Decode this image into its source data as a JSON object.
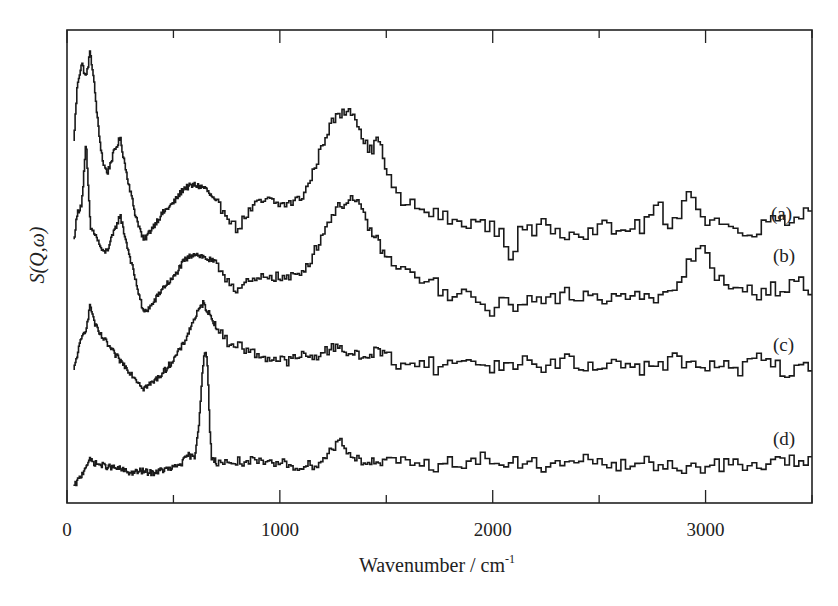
{
  "chart_data": {
    "type": "line",
    "title": "",
    "xlabel": "Wavenumber / cm",
    "xlabel_superscript": "-1",
    "ylabel": "S(Q,ω)",
    "xlim": [
      0,
      3500
    ],
    "ylim_note": "arbitrary units (no y ticks); values are relative intensities with vertical offsets",
    "x_ticks_major": [
      0,
      1000,
      2000,
      3000
    ],
    "x_tick_labels": [
      "0",
      "1000",
      "2000",
      "3000"
    ],
    "x_ticks_minor": [
      500,
      1500,
      2500,
      3500
    ],
    "grid": false,
    "legend": "inline labels at right",
    "step_style": true,
    "series": [
      {
        "name": "(a)",
        "label": "(a)",
        "points": [
          [
            30,
            355
          ],
          [
            50,
            420
          ],
          [
            70,
            440
          ],
          [
            90,
            425
          ],
          [
            110,
            452
          ],
          [
            130,
            415
          ],
          [
            150,
            370
          ],
          [
            170,
            340
          ],
          [
            190,
            330
          ],
          [
            220,
            350
          ],
          [
            250,
            365
          ],
          [
            280,
            330
          ],
          [
            320,
            290
          ],
          [
            360,
            262
          ],
          [
            400,
            275
          ],
          [
            450,
            290
          ],
          [
            500,
            300
          ],
          [
            550,
            315
          ],
          [
            600,
            318
          ],
          [
            650,
            315
          ],
          [
            700,
            300
          ],
          [
            750,
            290
          ],
          [
            800,
            273
          ],
          [
            850,
            290
          ],
          [
            900,
            300
          ],
          [
            950,
            303
          ],
          [
            1000,
            298
          ],
          [
            1050,
            300
          ],
          [
            1100,
            305
          ],
          [
            1140,
            320
          ],
          [
            1180,
            345
          ],
          [
            1220,
            370
          ],
          [
            1260,
            385
          ],
          [
            1300,
            390
          ],
          [
            1330,
            395
          ],
          [
            1360,
            385
          ],
          [
            1400,
            360
          ],
          [
            1440,
            350
          ],
          [
            1460,
            373
          ],
          [
            1490,
            340
          ],
          [
            1530,
            315
          ],
          [
            1560,
            303
          ],
          [
            1600,
            300
          ],
          [
            1650,
            295
          ],
          [
            1700,
            290
          ],
          [
            1750,
            288
          ],
          [
            1800,
            283
          ],
          [
            1850,
            278
          ],
          [
            1900,
            283
          ],
          [
            1940,
            278
          ],
          [
            2000,
            275
          ],
          [
            2050,
            270
          ],
          [
            2090,
            238
          ],
          [
            2130,
            280
          ],
          [
            2200,
            268
          ],
          [
            2250,
            280
          ],
          [
            2300,
            272
          ],
          [
            2350,
            270
          ],
          [
            2400,
            275
          ],
          [
            2450,
            268
          ],
          [
            2500,
            280
          ],
          [
            2550,
            273
          ],
          [
            2600,
            270
          ],
          [
            2650,
            278
          ],
          [
            2700,
            275
          ],
          [
            2780,
            301
          ],
          [
            2820,
            270
          ],
          [
            2860,
            280
          ],
          [
            2900,
            305
          ],
          [
            2920,
            318
          ],
          [
            2950,
            305
          ],
          [
            2980,
            283
          ],
          [
            3050,
            283
          ],
          [
            3100,
            278
          ],
          [
            3150,
            270
          ],
          [
            3200,
            275
          ],
          [
            3250,
            270
          ],
          [
            3300,
            285
          ],
          [
            3350,
            288
          ],
          [
            3400,
            282
          ],
          [
            3450,
            290
          ],
          [
            3500,
            293
          ]
        ]
      },
      {
        "name": "(b)",
        "label": "(b)",
        "points": [
          [
            30,
            260
          ],
          [
            50,
            290
          ],
          [
            70,
            300
          ],
          [
            90,
            360
          ],
          [
            110,
            275
          ],
          [
            130,
            270
          ],
          [
            150,
            260
          ],
          [
            170,
            250
          ],
          [
            190,
            253
          ],
          [
            220,
            270
          ],
          [
            250,
            288
          ],
          [
            280,
            260
          ],
          [
            320,
            225
          ],
          [
            360,
            190
          ],
          [
            400,
            198
          ],
          [
            450,
            215
          ],
          [
            500,
            225
          ],
          [
            550,
            242
          ],
          [
            600,
            250
          ],
          [
            650,
            245
          ],
          [
            700,
            240
          ],
          [
            750,
            225
          ],
          [
            800,
            213
          ],
          [
            850,
            220
          ],
          [
            900,
            223
          ],
          [
            950,
            228
          ],
          [
            1000,
            225
          ],
          [
            1050,
            225
          ],
          [
            1100,
            230
          ],
          [
            1150,
            245
          ],
          [
            1200,
            268
          ],
          [
            1250,
            290
          ],
          [
            1300,
            300
          ],
          [
            1340,
            305
          ],
          [
            1380,
            295
          ],
          [
            1420,
            275
          ],
          [
            1460,
            262
          ],
          [
            1500,
            245
          ],
          [
            1550,
            235
          ],
          [
            1600,
            230
          ],
          [
            1650,
            225
          ],
          [
            1700,
            225
          ],
          [
            1750,
            215
          ],
          [
            1800,
            203
          ],
          [
            1850,
            210
          ],
          [
            1900,
            205
          ],
          [
            1950,
            198
          ],
          [
            2000,
            193
          ],
          [
            2050,
            200
          ],
          [
            2100,
            196
          ],
          [
            2150,
            205
          ],
          [
            2200,
            200
          ],
          [
            2250,
            208
          ],
          [
            2300,
            200
          ],
          [
            2350,
            210
          ],
          [
            2400,
            205
          ],
          [
            2450,
            210
          ],
          [
            2500,
            203
          ],
          [
            2550,
            208
          ],
          [
            2600,
            213
          ],
          [
            2650,
            205
          ],
          [
            2700,
            208
          ],
          [
            2750,
            200
          ],
          [
            2800,
            205
          ],
          [
            2850,
            212
          ],
          [
            2900,
            230
          ],
          [
            2950,
            250
          ],
          [
            2980,
            260
          ],
          [
            3020,
            245
          ],
          [
            3060,
            225
          ],
          [
            3100,
            215
          ],
          [
            3150,
            210
          ],
          [
            3200,
            213
          ],
          [
            3250,
            210
          ],
          [
            3300,
            215
          ],
          [
            3350,
            213
          ],
          [
            3400,
            218
          ],
          [
            3450,
            220
          ],
          [
            3500,
            210
          ]
        ]
      },
      {
        "name": "(c)",
        "label": "(c)",
        "points": [
          [
            30,
            130
          ],
          [
            50,
            150
          ],
          [
            70,
            165
          ],
          [
            90,
            175
          ],
          [
            110,
            198
          ],
          [
            130,
            180
          ],
          [
            150,
            170
          ],
          [
            180,
            162
          ],
          [
            220,
            150
          ],
          [
            260,
            140
          ],
          [
            300,
            130
          ],
          [
            340,
            120
          ],
          [
            360,
            115
          ],
          [
            400,
            120
          ],
          [
            450,
            130
          ],
          [
            500,
            143
          ],
          [
            550,
            160
          ],
          [
            600,
            185
          ],
          [
            640,
            200
          ],
          [
            680,
            185
          ],
          [
            720,
            170
          ],
          [
            760,
            160
          ],
          [
            810,
            158
          ],
          [
            850,
            152
          ],
          [
            900,
            148
          ],
          [
            950,
            145
          ],
          [
            1000,
            143
          ],
          [
            1050,
            142
          ],
          [
            1100,
            148
          ],
          [
            1150,
            145
          ],
          [
            1200,
            150
          ],
          [
            1250,
            155
          ],
          [
            1280,
            158
          ],
          [
            1320,
            150
          ],
          [
            1360,
            148
          ],
          [
            1400,
            145
          ],
          [
            1460,
            153
          ],
          [
            1500,
            148
          ],
          [
            1550,
            140
          ],
          [
            1600,
            143
          ],
          [
            1650,
            135
          ],
          [
            1700,
            145
          ],
          [
            1750,
            130
          ],
          [
            1800,
            140
          ],
          [
            1850,
            145
          ],
          [
            1900,
            138
          ],
          [
            1950,
            142
          ],
          [
            2000,
            135
          ],
          [
            2100,
            140
          ],
          [
            2150,
            143
          ],
          [
            2200,
            135
          ],
          [
            2300,
            140
          ],
          [
            2350,
            145
          ],
          [
            2400,
            135
          ],
          [
            2500,
            133
          ],
          [
            2550,
            145
          ],
          [
            2600,
            138
          ],
          [
            2650,
            145
          ],
          [
            2700,
            130
          ],
          [
            2750,
            142
          ],
          [
            2800,
            138
          ],
          [
            2850,
            145
          ],
          [
            2900,
            140
          ],
          [
            2950,
            135
          ],
          [
            3000,
            140
          ],
          [
            3050,
            135
          ],
          [
            3100,
            138
          ],
          [
            3150,
            128
          ],
          [
            3200,
            140
          ],
          [
            3250,
            148
          ],
          [
            3300,
            140
          ],
          [
            3350,
            135
          ],
          [
            3400,
            128
          ],
          [
            3450,
            135
          ],
          [
            3500,
            138
          ]
        ]
      },
      {
        "name": "(d)",
        "label": "(d)",
        "points": [
          [
            30,
            15
          ],
          [
            50,
            22
          ],
          [
            70,
            28
          ],
          [
            90,
            38
          ],
          [
            110,
            43
          ],
          [
            130,
            40
          ],
          [
            160,
            38
          ],
          [
            200,
            36
          ],
          [
            250,
            34
          ],
          [
            300,
            30
          ],
          [
            350,
            32
          ],
          [
            400,
            30
          ],
          [
            450,
            33
          ],
          [
            500,
            35
          ],
          [
            540,
            40
          ],
          [
            570,
            48
          ],
          [
            600,
            45
          ],
          [
            620,
            80
          ],
          [
            640,
            140
          ],
          [
            650,
            151
          ],
          [
            660,
            140
          ],
          [
            670,
            80
          ],
          [
            680,
            45
          ],
          [
            700,
            42
          ],
          [
            750,
            40
          ],
          [
            800,
            41
          ],
          [
            850,
            42
          ],
          [
            900,
            40
          ],
          [
            950,
            38
          ],
          [
            1000,
            40
          ],
          [
            1050,
            38
          ],
          [
            1100,
            36
          ],
          [
            1150,
            38
          ],
          [
            1200,
            42
          ],
          [
            1250,
            55
          ],
          [
            1280,
            64
          ],
          [
            1310,
            55
          ],
          [
            1350,
            45
          ],
          [
            1400,
            42
          ],
          [
            1450,
            40
          ],
          [
            1500,
            40
          ],
          [
            1550,
            38
          ],
          [
            1600,
            42
          ],
          [
            1650,
            38
          ],
          [
            1700,
            40
          ],
          [
            1750,
            36
          ],
          [
            1800,
            40
          ],
          [
            1850,
            42
          ],
          [
            1900,
            40
          ],
          [
            1950,
            45
          ],
          [
            2000,
            43
          ],
          [
            2050,
            38
          ],
          [
            2100,
            40
          ],
          [
            2150,
            38
          ],
          [
            2200,
            40
          ],
          [
            2250,
            36
          ],
          [
            2300,
            38
          ],
          [
            2400,
            40
          ],
          [
            2500,
            44
          ],
          [
            2550,
            38
          ],
          [
            2600,
            36
          ],
          [
            2700,
            40
          ],
          [
            2800,
            38
          ],
          [
            2900,
            36
          ],
          [
            3000,
            37
          ],
          [
            3100,
            38
          ],
          [
            3200,
            36
          ],
          [
            3300,
            40
          ],
          [
            3400,
            42
          ],
          [
            3500,
            40
          ]
        ]
      }
    ]
  },
  "labels": {
    "x_axis_title": "Wavenumber / cm",
    "x_axis_superscript": "-1",
    "y_axis_title": "S(Q,ω)",
    "curve_a": "(a)",
    "curve_b": "(b)",
    "curve_c": "(c)",
    "curve_d": "(d)",
    "tick_0": "0",
    "tick_1000": "1000",
    "tick_2000": "2000",
    "tick_3000": "3000"
  }
}
